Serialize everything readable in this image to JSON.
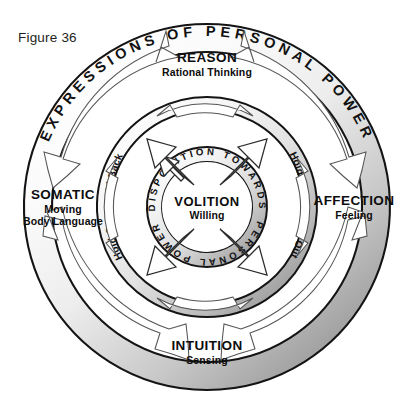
{
  "figure": {
    "label": "Figure 36"
  },
  "rings": {
    "outer": {
      "arc_label": "EXPRESSIONS OF PERSONAL POWER",
      "quadrants": [
        {
          "id": "reason",
          "title": "REASON",
          "subtitle": "Rational Thinking",
          "position": "top"
        },
        {
          "id": "affection",
          "title": "AFFECTION",
          "subtitle": "Feeling",
          "position": "right"
        },
        {
          "id": "intuition",
          "title": "INTUITION",
          "subtitle": "Sensing",
          "position": "bottom"
        },
        {
          "id": "somatic",
          "title": "SOMATIC",
          "subtitle": "Moving",
          "subtitle2": "Body Language",
          "position": "left"
        }
      ]
    },
    "middle": {
      "labels": [
        {
          "id": "hold-back",
          "text": "Hold Back",
          "position": "upper-left"
        },
        {
          "id": "hold-forth",
          "text": "Hold Forth",
          "position": "upper-right"
        },
        {
          "id": "hold-onto",
          "text": "Hold Onto",
          "position": "lower-left"
        },
        {
          "id": "hold-out",
          "text": "Hold Out",
          "position": "lower-right"
        }
      ]
    },
    "inner": {
      "arc_top": "DISPOSITION TOWARDS",
      "arc_bottom": "PERSONAL POWER",
      "title": "VOLITION",
      "subtitle": "Willing"
    }
  },
  "colors": {
    "ink": "#111111",
    "ring_stroke": "#1a1a1a",
    "ring_light": "#ffffff",
    "ring_shade": "#8d8d8d",
    "background": "#ffffff"
  }
}
